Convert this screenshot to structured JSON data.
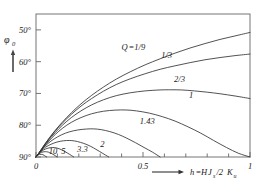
{
  "chart_data": {
    "type": "line",
    "title": "",
    "xlabel": "h=HJs/2Ku",
    "ylabel": "φ0",
    "xlim": [
      0,
      1
    ],
    "ylim": [
      90,
      45
    ],
    "y_inverted": true,
    "grid": false,
    "legend_position": "inline-curve-labels",
    "xticks": [
      0,
      0.5,
      1
    ],
    "xticklabels": [
      "0",
      "0.5",
      "1"
    ],
    "xminor_step": 0.1,
    "yticks": [
      50,
      60,
      70,
      80,
      90
    ],
    "yticklabels": [
      "50°",
      "60°",
      "70°",
      "80°",
      "90°"
    ],
    "series": [
      {
        "name": "Q=1/9",
        "label": "Q=1/9",
        "label_x": 0.4,
        "label_y": 56.2,
        "points": [
          [
            0.0,
            90.0
          ],
          [
            0.015,
            88.6
          ],
          [
            0.035,
            86.6
          ],
          [
            0.06,
            84.2
          ],
          [
            0.09,
            81.6
          ],
          [
            0.125,
            78.9
          ],
          [
            0.165,
            76.1
          ],
          [
            0.21,
            73.3
          ],
          [
            0.26,
            70.6
          ],
          [
            0.315,
            68.0
          ],
          [
            0.375,
            65.5
          ],
          [
            0.44,
            63.2
          ],
          [
            0.51,
            61.0
          ],
          [
            0.58,
            59.1
          ],
          [
            0.65,
            57.3
          ],
          [
            0.72,
            55.7
          ],
          [
            0.79,
            54.3
          ],
          [
            0.86,
            53.0
          ],
          [
            0.93,
            51.9
          ],
          [
            1.0,
            50.8
          ]
        ]
      },
      {
        "name": "Q=1/3",
        "label": "1/3",
        "label_x": 0.585,
        "label_y": 58.7,
        "points": [
          [
            0.0,
            90.0
          ],
          [
            0.015,
            88.6
          ],
          [
            0.035,
            86.6
          ],
          [
            0.06,
            84.3
          ],
          [
            0.09,
            81.8
          ],
          [
            0.125,
            79.2
          ],
          [
            0.165,
            76.6
          ],
          [
            0.21,
            74.0
          ],
          [
            0.26,
            71.6
          ],
          [
            0.315,
            69.3
          ],
          [
            0.375,
            67.2
          ],
          [
            0.44,
            65.4
          ],
          [
            0.51,
            63.8
          ],
          [
            0.58,
            62.4
          ],
          [
            0.65,
            61.3
          ],
          [
            0.72,
            60.3
          ],
          [
            0.79,
            59.4
          ],
          [
            0.86,
            58.7
          ],
          [
            0.93,
            58.1
          ],
          [
            1.0,
            57.6
          ]
        ]
      },
      {
        "name": "Q=2/3",
        "label": "2/3",
        "label_x": 0.645,
        "label_y": 66.5,
        "points": [
          [
            0.0,
            90.0
          ],
          [
            0.015,
            88.7
          ],
          [
            0.035,
            86.8
          ],
          [
            0.06,
            84.6
          ],
          [
            0.09,
            82.3
          ],
          [
            0.125,
            79.9
          ],
          [
            0.165,
            77.6
          ],
          [
            0.21,
            75.5
          ],
          [
            0.26,
            73.6
          ],
          [
            0.315,
            72.0
          ],
          [
            0.375,
            70.7
          ],
          [
            0.44,
            69.8
          ],
          [
            0.51,
            69.2
          ],
          [
            0.58,
            68.9
          ],
          [
            0.63,
            68.85
          ],
          [
            0.68,
            68.9
          ],
          [
            0.74,
            69.2
          ],
          [
            0.8,
            69.6
          ],
          [
            0.86,
            70.1
          ],
          [
            0.93,
            70.8
          ],
          [
            1.0,
            71.6
          ]
        ]
      },
      {
        "name": "Q=1",
        "label": "1",
        "label_x": 0.715,
        "label_y": 71.5,
        "points": [
          [
            0.0,
            90.0
          ],
          [
            0.015,
            88.8
          ],
          [
            0.035,
            87.0
          ],
          [
            0.06,
            85.0
          ],
          [
            0.09,
            82.9
          ],
          [
            0.125,
            80.9
          ],
          [
            0.165,
            79.1
          ],
          [
            0.21,
            77.6
          ],
          [
            0.26,
            76.4
          ],
          [
            0.315,
            75.6
          ],
          [
            0.37,
            75.25
          ],
          [
            0.42,
            75.2
          ],
          [
            0.47,
            75.5
          ],
          [
            0.53,
            76.2
          ],
          [
            0.59,
            77.3
          ],
          [
            0.65,
            78.7
          ],
          [
            0.71,
            80.5
          ],
          [
            0.77,
            82.5
          ],
          [
            0.83,
            84.8
          ],
          [
            0.89,
            87.0
          ],
          [
            0.945,
            88.8
          ],
          [
            1.0,
            90.0
          ]
        ]
      },
      {
        "name": "Q=1.43",
        "label": "1.43",
        "label_x": 0.485,
        "label_y": 79.6,
        "points": [
          [
            0.0,
            90.0
          ],
          [
            0.012,
            88.9
          ],
          [
            0.03,
            87.4
          ],
          [
            0.055,
            85.8
          ],
          [
            0.085,
            84.3
          ],
          [
            0.12,
            83.0
          ],
          [
            0.155,
            82.1
          ],
          [
            0.195,
            81.5
          ],
          [
            0.235,
            81.2
          ],
          [
            0.27,
            81.15
          ],
          [
            0.305,
            81.4
          ],
          [
            0.345,
            82.0
          ],
          [
            0.385,
            82.9
          ],
          [
            0.425,
            84.1
          ],
          [
            0.465,
            85.5
          ],
          [
            0.505,
            87.0
          ],
          [
            0.545,
            88.5
          ],
          [
            0.58,
            90.0
          ]
        ]
      },
      {
        "name": "Q=2",
        "label": "2",
        "label_x": 0.3,
        "label_y": 86.8,
        "points": [
          [
            0.0,
            90.0
          ],
          [
            0.01,
            89.1
          ],
          [
            0.025,
            88.0
          ],
          [
            0.045,
            86.9
          ],
          [
            0.07,
            86.0
          ],
          [
            0.098,
            85.3
          ],
          [
            0.128,
            84.9
          ],
          [
            0.155,
            84.8
          ],
          [
            0.18,
            84.95
          ],
          [
            0.208,
            85.4
          ],
          [
            0.238,
            86.1
          ],
          [
            0.268,
            87.1
          ],
          [
            0.298,
            88.3
          ],
          [
            0.325,
            89.4
          ],
          [
            0.34,
            90.0
          ]
        ]
      },
      {
        "name": "Q=3.3",
        "label": "3.3",
        "label_x": 0.192,
        "label_y": 88.3,
        "points": [
          [
            0.0,
            90.0
          ],
          [
            0.008,
            89.3
          ],
          [
            0.02,
            88.5
          ],
          [
            0.035,
            87.8
          ],
          [
            0.052,
            87.3
          ],
          [
            0.07,
            87.05
          ],
          [
            0.088,
            87.05
          ],
          [
            0.108,
            87.4
          ],
          [
            0.128,
            88.0
          ],
          [
            0.148,
            88.8
          ],
          [
            0.165,
            89.5
          ],
          [
            0.176,
            90.0
          ]
        ]
      },
      {
        "name": "Q=5",
        "label": "5",
        "label_x": 0.118,
        "label_y": 88.9,
        "points": [
          [
            0.0,
            90.0
          ],
          [
            0.006,
            89.5
          ],
          [
            0.014,
            88.95
          ],
          [
            0.025,
            88.55
          ],
          [
            0.037,
            88.35
          ],
          [
            0.05,
            88.35
          ],
          [
            0.064,
            88.6
          ],
          [
            0.078,
            89.1
          ],
          [
            0.09,
            89.6
          ],
          [
            0.098,
            90.0
          ]
        ]
      },
      {
        "name": "Q=10",
        "label": "10",
        "label_x": 0.06,
        "label_y": 89.0,
        "points": [
          [
            0.0,
            90.0
          ],
          [
            0.004,
            89.7
          ],
          [
            0.009,
            89.4
          ],
          [
            0.016,
            89.2
          ],
          [
            0.024,
            89.15
          ],
          [
            0.032,
            89.25
          ],
          [
            0.04,
            89.55
          ],
          [
            0.046,
            89.85
          ],
          [
            0.05,
            90.0
          ]
        ]
      }
    ]
  },
  "axes": {
    "y_label_main": "φ",
    "y_label_sub": "0",
    "x_label_lhs": "h",
    "x_label_eq": "=",
    "x_label_H": "H",
    "x_label_J": "J",
    "x_label_J_sub": "s",
    "x_label_slash": "/2",
    "x_label_K": "K",
    "x_label_K_sub": "u",
    "x_arrow": "⟶",
    "y_arrow": "↑"
  },
  "style": {
    "frame_color": "#555555",
    "curve_color": "#333333",
    "text_color": "#1a1a1a",
    "background": "#ffffff"
  }
}
